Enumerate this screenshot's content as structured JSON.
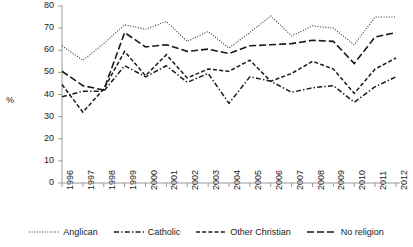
{
  "chart_data": {
    "type": "line",
    "title": "",
    "subtitle": "",
    "xlabel": "",
    "ylabel": "%",
    "ylim": [
      0,
      80
    ],
    "ytick_step": 10,
    "yticks": [
      80,
      70,
      60,
      50,
      40,
      30,
      20,
      10,
      0
    ],
    "grid": false,
    "legend_position": "bottom",
    "x": [
      1996,
      1997,
      1998,
      1999,
      2000,
      2001,
      2002,
      2003,
      2004,
      2005,
      2006,
      2007,
      2008,
      2009,
      2010,
      2011,
      2012
    ],
    "categories": [
      "1996",
      "1997",
      "1998",
      "1999",
      "2000",
      "2001",
      "2002",
      "2003",
      "2004",
      "2005",
      "2006",
      "2007",
      "2008",
      "2009",
      "2010",
      "2011",
      "2012"
    ],
    "series": [
      {
        "name": "Anglican",
        "dash": "dotted",
        "color": "#333333",
        "values": [
          62,
          55.5,
          63,
          71.5,
          69.5,
          73,
          64,
          68.5,
          61,
          68,
          75.5,
          66.5,
          71,
          70,
          62.5,
          75,
          75
        ]
      },
      {
        "name": "Catholic",
        "dash": "dash-dot",
        "color": "#1a1a1a",
        "values": [
          39,
          41.5,
          41.5,
          53,
          48,
          53,
          45.5,
          49.5,
          36,
          48,
          46,
          41,
          43,
          44,
          36.5,
          43.5,
          48
        ]
      },
      {
        "name": "Other Christian",
        "dash": "short-dash",
        "color": "#1a1a1a",
        "values": [
          44.5,
          32,
          42.5,
          59.5,
          48.5,
          58,
          47.5,
          51.5,
          50.5,
          55.5,
          46,
          49.5,
          55,
          51.5,
          40.5,
          51.5,
          56.5
        ]
      },
      {
        "name": "No religion",
        "dash": "long-dash",
        "color": "#1a1a1a",
        "values": [
          50.5,
          44,
          42,
          68,
          61.5,
          62.5,
          59.5,
          60.5,
          58.5,
          62,
          62.5,
          63,
          64.5,
          64,
          54,
          66,
          68
        ]
      }
    ]
  },
  "axes": {
    "y_label": "%"
  },
  "legend": {
    "items": [
      {
        "label": "Anglican",
        "icon": "dotted-line-icon"
      },
      {
        "label": "Catholic",
        "icon": "dash-dot-line-icon"
      },
      {
        "label": "Other Christian",
        "icon": "short-dash-line-icon"
      },
      {
        "label": "No religion",
        "icon": "long-dash-line-icon"
      }
    ]
  }
}
